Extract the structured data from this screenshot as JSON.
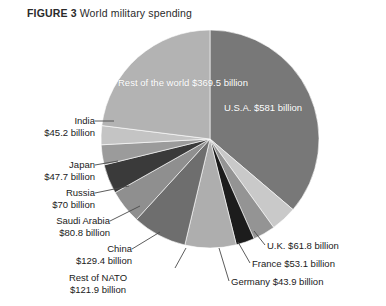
{
  "title": {
    "figure_label": "FIGURE 3",
    "text": "World military spending"
  },
  "chart_data": {
    "type": "pie",
    "title": "World military spending",
    "unit": "billion USD",
    "value_prefix": "$",
    "value_suffix": " billion",
    "start_angle_deg": 0,
    "direction": "clockwise",
    "legend": "none",
    "grid": false,
    "categories": [
      "U.S.A.",
      "U.K.",
      "France",
      "Germany",
      "Rest of NATO",
      "China",
      "Saudi Arabia",
      "Russia",
      "Japan",
      "India",
      "Rest of the world"
    ],
    "values": [
      581,
      61.8,
      53.1,
      43.9,
      121.9,
      129.4,
      80.8,
      70,
      47.7,
      45.2,
      369.5
    ],
    "value_labels": [
      "$581 billion",
      "$61.8 billion",
      "$53.1 billion",
      "$43.9 billion",
      "$121.9 billion",
      "$129.4 billion",
      "$80.8 billion",
      "$70 billion",
      "$47.7 billion",
      "$45.2 billion",
      "$369.5 billion"
    ],
    "colors": [
      "#787878",
      "#c9c9c9",
      "#949494",
      "#1c1c1c",
      "#aeaeae",
      "#6e6e6e",
      "#8f8f8f",
      "#3a3a3a",
      "#9b9b9b",
      "#c4c4c4",
      "#b3b3b3"
    ]
  },
  "slices": {
    "usa": {
      "name": "U.S.A.",
      "value": "$581 billion"
    },
    "row": {
      "name": "Rest of the world",
      "value": "$369.5 billion"
    }
  },
  "callouts": {
    "india": {
      "name": "India",
      "value": "$45.2 billion"
    },
    "japan": {
      "name": "Japan",
      "value": "$47.7 billion"
    },
    "russia": {
      "name": "Russia",
      "value": "$70 billion"
    },
    "saudi": {
      "name": "Saudi Arabia",
      "value": "$80.8 billion"
    },
    "china": {
      "name": "China",
      "value": "$129.4 billion"
    },
    "nato": {
      "name": "Rest of NATO",
      "value": "$121.9 billion"
    },
    "uk": {
      "text": "U.K. $61.8 billion"
    },
    "france": {
      "text": "France $53.1 billion"
    },
    "germany": {
      "text": "Germany $43.9 billion"
    }
  }
}
